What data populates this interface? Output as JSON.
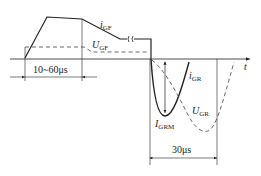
{
  "diagram": {
    "type": "gate current/voltage waveform",
    "labels": {
      "i_gf": {
        "main": "i",
        "sub": "GF"
      },
      "u_gf": {
        "main": "U",
        "sub": "GF"
      },
      "i_gr": {
        "main": "i",
        "sub": "GR"
      },
      "u_gr": {
        "main": "U",
        "sub": "GR"
      },
      "i_grm": {
        "main": "I",
        "sub": "GRM"
      },
      "t_axis": "t"
    },
    "dimensions": {
      "turn_on_width": "10~60μs",
      "turn_off_width": "30μs"
    },
    "colors": {
      "line": "#222222",
      "background": "#ffffff"
    }
  }
}
